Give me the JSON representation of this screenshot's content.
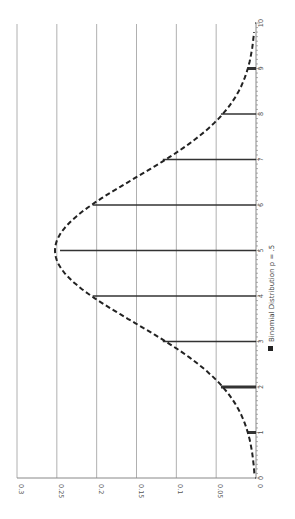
{
  "chart_data": {
    "type": "bar",
    "orientation": "rotated 90deg clockwise (categories along vertical axis, values along horizontal)",
    "title": "",
    "xlabel": "",
    "ylabel": "",
    "categories": [
      "0",
      "1",
      "2",
      "3",
      "4",
      "5",
      "6",
      "7",
      "8",
      "9",
      "10"
    ],
    "series": [
      {
        "name": "Binomial Distribution p = .5",
        "style": "thin bars / stems",
        "values": [
          0.001,
          0.01,
          0.044,
          0.117,
          0.205,
          0.246,
          0.205,
          0.117,
          0.044,
          0.01,
          0.001
        ]
      },
      {
        "name": "normal approximation curve",
        "style": "dashed line",
        "x": [
          0.1,
          1,
          2,
          3,
          4,
          5,
          6,
          7,
          8,
          9,
          9.8
        ],
        "values": [
          0.004,
          0.013,
          0.047,
          0.114,
          0.205,
          0.252,
          0.205,
          0.114,
          0.047,
          0.013,
          0.004
        ]
      }
    ],
    "value_ticks": [
      "0",
      "0.05",
      "0.1",
      "0.15",
      "0.2",
      "0.25",
      "0.3"
    ],
    "category_ticks": [
      "0",
      "1",
      "2",
      "3",
      "4",
      "5",
      "6",
      "7",
      "8",
      "9",
      "10"
    ],
    "ylim": [
      0,
      0.3
    ],
    "grid": true,
    "legend": {
      "position": "bottom (rotated right side)",
      "entries": [
        "Binomial Distribution p = .5"
      ]
    }
  },
  "legend": {
    "label": "Binomial Distribution p = .5"
  },
  "colors": {
    "bar": "#333333",
    "grid": "#b0b0b0",
    "curve": "#222222",
    "axis": "#888888"
  }
}
